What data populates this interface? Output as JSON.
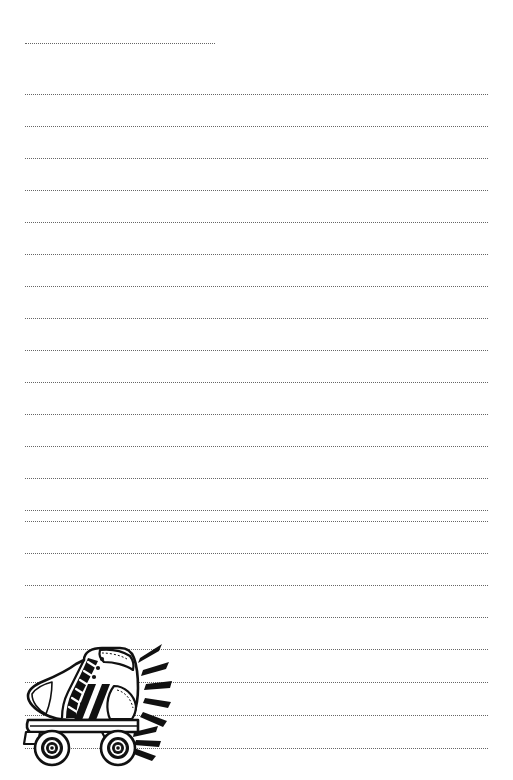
{
  "page": {
    "width": 513,
    "height": 780,
    "background_color": "#ffffff",
    "paper_type": "dotted-rule lined writing paper",
    "orientation": "portrait"
  },
  "rules": {
    "label": "writing lines",
    "count": 23,
    "style": "dotted",
    "color": "#5a5a5a",
    "thickness_px": 1.4,
    "left_margin_x": 25,
    "right_margin_x": 488,
    "line_spacing_px": 31.6,
    "first_line_y": 43,
    "lines": [
      {
        "index": 1,
        "y": 43,
        "x_start": 25,
        "x_end": 215,
        "note": "short opening line"
      },
      {
        "index": 2,
        "y": 94,
        "x_start": 25,
        "x_end": 488,
        "note": ""
      },
      {
        "index": 3,
        "y": 126,
        "x_start": 25,
        "x_end": 488,
        "note": ""
      },
      {
        "index": 4,
        "y": 158,
        "x_start": 25,
        "x_end": 488,
        "note": ""
      },
      {
        "index": 5,
        "y": 190,
        "x_start": 25,
        "x_end": 488,
        "note": ""
      },
      {
        "index": 6,
        "y": 222,
        "x_start": 25,
        "x_end": 488,
        "note": ""
      },
      {
        "index": 7,
        "y": 254,
        "x_start": 25,
        "x_end": 488,
        "note": ""
      },
      {
        "index": 8,
        "y": 286,
        "x_start": 25,
        "x_end": 488,
        "note": ""
      },
      {
        "index": 9,
        "y": 318,
        "x_start": 25,
        "x_end": 488,
        "note": ""
      },
      {
        "index": 10,
        "y": 350,
        "x_start": 25,
        "x_end": 488,
        "note": ""
      },
      {
        "index": 11,
        "y": 382,
        "x_start": 25,
        "x_end": 488,
        "note": ""
      },
      {
        "index": 12,
        "y": 414,
        "x_start": 25,
        "x_end": 488,
        "note": ""
      },
      {
        "index": 13,
        "y": 446,
        "x_start": 25,
        "x_end": 488,
        "note": ""
      },
      {
        "index": 14,
        "y": 478,
        "x_start": 25,
        "x_end": 488,
        "note": ""
      },
      {
        "index": 15,
        "y": 510,
        "x_start": 25,
        "x_end": 488,
        "note": ""
      },
      {
        "index": 16,
        "y": 521,
        "x_start": 25,
        "x_end": 488,
        "note": ""
      },
      {
        "index": 17,
        "y": 553,
        "x_start": 25,
        "x_end": 488,
        "note": ""
      },
      {
        "index": 18,
        "y": 585,
        "x_start": 25,
        "x_end": 488,
        "note": ""
      },
      {
        "index": 19,
        "y": 617,
        "x_start": 25,
        "x_end": 488,
        "note": ""
      },
      {
        "index": 20,
        "y": 649,
        "x_start": 25,
        "x_end": 488,
        "note": "crosses illustration"
      },
      {
        "index": 21,
        "y": 682,
        "x_start": 25,
        "x_end": 488,
        "note": "crosses illustration"
      },
      {
        "index": 22,
        "y": 715,
        "x_start": 25,
        "x_end": 488,
        "note": "crosses illustration"
      },
      {
        "index": 23,
        "y": 748,
        "x_start": 25,
        "x_end": 488,
        "note": "crosses illustration"
      }
    ]
  },
  "illustration": {
    "name": "roller-skate",
    "description": "Black and white line-art drawing of a high-top quad roller skate in side profile facing left, with motion/action lines radiating from the rear",
    "position": {
      "x": 22,
      "y": 640,
      "width": 160,
      "height": 130
    },
    "ink_color": "#111111",
    "fill_color": "#ffffff",
    "parts": [
      {
        "name": "boot-upper",
        "label": "high-top boot upper"
      },
      {
        "name": "boot-collar",
        "label": "padded ankle collar"
      },
      {
        "name": "tongue",
        "label": "tongue"
      },
      {
        "name": "laces",
        "label": "criss-cross laces"
      },
      {
        "name": "eyelets",
        "label": "lace eyelets",
        "count": 7
      },
      {
        "name": "heel-counter",
        "label": "heel counter panel"
      },
      {
        "name": "toe-cap",
        "label": "toe cap"
      },
      {
        "name": "racing-stripes",
        "label": "diagonal side stripes",
        "count": 2
      },
      {
        "name": "sole-plate",
        "label": "chassis / sole plate"
      },
      {
        "name": "front-wheel",
        "label": "front wheel with hub"
      },
      {
        "name": "rear-wheel",
        "label": "rear wheel with hub"
      },
      {
        "name": "toe-stop",
        "label": "toe stop"
      },
      {
        "name": "motion-lines",
        "label": "speed / action lines",
        "count": 8
      }
    ]
  }
}
